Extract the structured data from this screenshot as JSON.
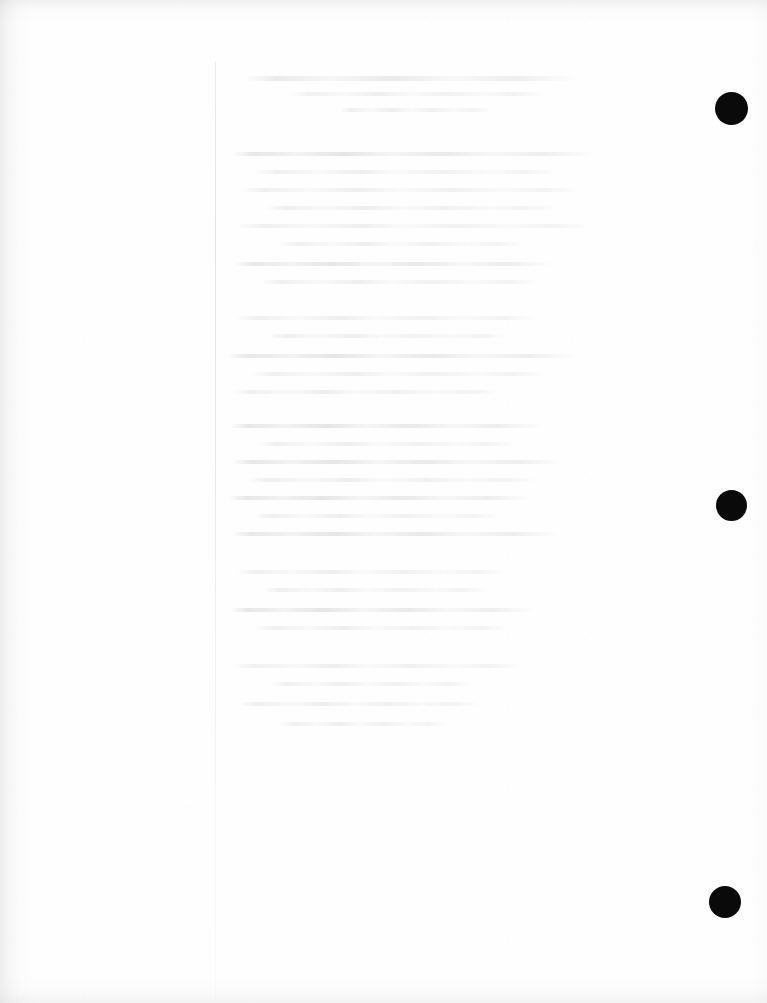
{
  "page": {
    "kind": "scanned-document-page",
    "title": "Scanned Document Page",
    "orientation": "portrait",
    "width_px": 767,
    "height_px": 1003,
    "paper_color": "#fefefe",
    "content_state": "blank",
    "content_note": "",
    "legible_text": ""
  },
  "colors": {
    "paper": "#fefefe",
    "punch_hole": "#0a0a0a",
    "margin_rule": "#a5a5ac",
    "ghost_text": "#b0b0b8",
    "scan_shadow": "#96969b"
  },
  "margin_rule": {
    "label": "",
    "x_px": 215,
    "top_px": 62,
    "bottom_px": 1000
  },
  "punch_holes": [
    {
      "label": "",
      "index": 1,
      "cx_px": 731,
      "cy_px": 108,
      "diameter_px": 33
    },
    {
      "label": "",
      "index": 2,
      "cx_px": 731,
      "cy_px": 505,
      "diameter_px": 31
    },
    {
      "label": "",
      "index": 3,
      "cx_px": 725,
      "cy_px": 902,
      "diameter_px": 32
    }
  ],
  "ghost_text_block": {
    "label": "",
    "left_px": 222,
    "top_px": 72,
    "width_px": 404,
    "height_px": 662,
    "lines": [
      {
        "top": 4,
        "left": 24,
        "width": 330,
        "variant": "heading"
      },
      {
        "top": 20,
        "left": 70,
        "width": 250,
        "variant": "normal"
      },
      {
        "top": 36,
        "left": 118,
        "width": 150,
        "variant": "normal"
      },
      {
        "top": 80,
        "left": 10,
        "width": 360,
        "variant": "dense"
      },
      {
        "top": 98,
        "left": 34,
        "width": 300,
        "variant": "normal"
      },
      {
        "top": 116,
        "left": 18,
        "width": 340,
        "variant": "normal"
      },
      {
        "top": 134,
        "left": 44,
        "width": 290,
        "variant": "normal"
      },
      {
        "top": 152,
        "left": 16,
        "width": 352,
        "variant": "normal"
      },
      {
        "top": 170,
        "left": 58,
        "width": 244,
        "variant": "normal"
      },
      {
        "top": 190,
        "left": 12,
        "width": 318,
        "variant": "dense"
      },
      {
        "top": 208,
        "left": 40,
        "width": 276,
        "variant": "normal"
      },
      {
        "top": 244,
        "left": 14,
        "width": 300,
        "variant": "normal"
      },
      {
        "top": 262,
        "left": 48,
        "width": 236,
        "variant": "normal"
      },
      {
        "top": 282,
        "left": 6,
        "width": 348,
        "variant": "dense"
      },
      {
        "top": 300,
        "left": 30,
        "width": 292,
        "variant": "normal"
      },
      {
        "top": 318,
        "left": 12,
        "width": 264,
        "variant": "normal"
      },
      {
        "top": 352,
        "left": 8,
        "width": 312,
        "variant": "dense"
      },
      {
        "top": 370,
        "left": 36,
        "width": 258,
        "variant": "normal"
      },
      {
        "top": 388,
        "left": 10,
        "width": 330,
        "variant": "dense"
      },
      {
        "top": 406,
        "left": 26,
        "width": 288,
        "variant": "normal"
      },
      {
        "top": 424,
        "left": 6,
        "width": 302,
        "variant": "dense"
      },
      {
        "top": 442,
        "left": 32,
        "width": 246,
        "variant": "normal"
      },
      {
        "top": 460,
        "left": 10,
        "width": 326,
        "variant": "dense"
      },
      {
        "top": 498,
        "left": 14,
        "width": 270,
        "variant": "normal"
      },
      {
        "top": 516,
        "left": 42,
        "width": 222,
        "variant": "normal"
      },
      {
        "top": 536,
        "left": 8,
        "width": 304,
        "variant": "dense"
      },
      {
        "top": 554,
        "left": 34,
        "width": 252,
        "variant": "normal"
      },
      {
        "top": 592,
        "left": 12,
        "width": 286,
        "variant": "normal"
      },
      {
        "top": 610,
        "left": 50,
        "width": 200,
        "variant": "normal"
      },
      {
        "top": 630,
        "left": 18,
        "width": 238,
        "variant": "normal"
      },
      {
        "top": 650,
        "left": 60,
        "width": 164,
        "variant": "normal"
      }
    ]
  }
}
